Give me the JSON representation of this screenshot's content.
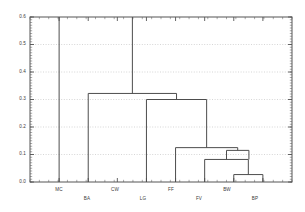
{
  "chart_data": {
    "type": "line",
    "chart_kind": "dendrogram",
    "title": "",
    "xlabel": "",
    "ylabel": "",
    "ylim": [
      0.0,
      0.6
    ],
    "yticks": [
      "0.0",
      "0.1",
      "0.2",
      "0.3",
      "0.4",
      "0.5",
      "0.6"
    ],
    "ytick_values": [
      0.0,
      0.1,
      0.2,
      0.3,
      0.4,
      0.5,
      0.6
    ],
    "grid": true,
    "grid_axis": "y",
    "grid_style": "dotted",
    "legend": false,
    "leaves": [
      "MC",
      "BA",
      "CW",
      "LG",
      "FF",
      "FV",
      "BW",
      "BP"
    ],
    "leaf_positions": [
      1,
      2,
      3,
      4,
      5,
      6,
      7,
      8
    ],
    "leaf_label_rows": [
      0,
      1,
      0,
      1,
      0,
      1,
      0,
      1
    ],
    "merges": [
      {
        "id": "m1",
        "left": "BW",
        "right": "BP",
        "height": 0.027
      },
      {
        "id": "m2",
        "left": "FV",
        "right": "m1",
        "height": 0.082
      },
      {
        "id": "m3",
        "left": "m2",
        "right": "",
        "height": 0.115
      },
      {
        "id": "m4",
        "left": "FF",
        "right": "m3",
        "height": 0.125
      },
      {
        "id": "m5",
        "left": "LG",
        "right": "m4",
        "height": 0.3
      },
      {
        "id": "m6",
        "left": "BA",
        "right": "m5",
        "height": 0.322
      },
      {
        "id": "m7",
        "left": "MC",
        "right": "CW",
        "height": 0.6,
        "clipped": true
      }
    ],
    "clipped_stems": [
      "MC",
      "CW"
    ],
    "colors": {
      "line": "#4d4d4d",
      "axis": "#555555",
      "grid": "#bbbbbb",
      "background": "#ffffff",
      "text": "#3a3a3a"
    }
  }
}
